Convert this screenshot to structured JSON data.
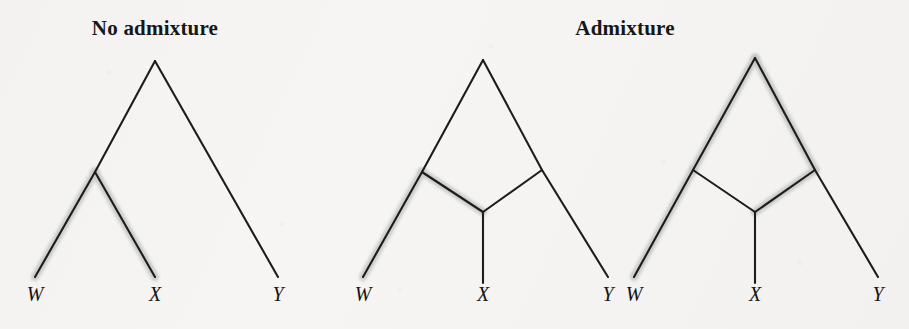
{
  "figure": {
    "width": 909,
    "height": 329,
    "background_color": "#f6f5f3",
    "line_color": "#1d1d1d",
    "highlight_color": "#c9c9c9"
  },
  "panels": [
    {
      "id": "no-admixture",
      "title": "No admixture",
      "title_x": 155,
      "title_y": 32,
      "type": "bifurcating-tree",
      "leaves": [
        {
          "label": "W",
          "x": 35,
          "y": 298
        },
        {
          "label": "X",
          "x": 155,
          "y": 298
        },
        {
          "label": "Y",
          "x": 278,
          "y": 298
        }
      ],
      "nodes": {
        "root": {
          "x": 155,
          "y": 61
        },
        "internal": {
          "x": 95,
          "y": 172
        }
      },
      "edges": [
        {
          "name": "root-to-internal",
          "from": [
            155,
            61
          ],
          "to": [
            95,
            172
          ],
          "highlighted": false
        },
        {
          "name": "root-to-Y",
          "from": [
            155,
            61
          ],
          "to": [
            278,
            277
          ],
          "highlighted": false
        },
        {
          "name": "internal-to-W",
          "from": [
            95,
            172
          ],
          "to": [
            35,
            277
          ],
          "highlighted": true
        },
        {
          "name": "internal-to-X",
          "from": [
            95,
            172
          ],
          "to": [
            155,
            277
          ],
          "highlighted": true
        }
      ]
    },
    {
      "id": "admixture-left",
      "title": "Admixture",
      "title_x": 625,
      "title_y": 32,
      "type": "admixture-graph",
      "leaves": [
        {
          "label": "W",
          "x": 363,
          "y": 298
        },
        {
          "label": "X",
          "x": 483,
          "y": 298
        },
        {
          "label": "Y",
          "x": 608,
          "y": 298
        }
      ],
      "nodes": {
        "root": {
          "x": 483,
          "y": 60
        },
        "left-node": {
          "x": 422,
          "y": 172
        },
        "right-node": {
          "x": 542,
          "y": 170
        },
        "admix-node": {
          "x": 483,
          "y": 212
        }
      },
      "edges": [
        {
          "name": "root-to-left-node",
          "from": [
            483,
            60
          ],
          "to": [
            422,
            172
          ],
          "highlighted": false
        },
        {
          "name": "root-to-right-node",
          "from": [
            483,
            60
          ],
          "to": [
            542,
            170
          ],
          "highlighted": false
        },
        {
          "name": "left-node-to-W",
          "from": [
            422,
            172
          ],
          "to": [
            363,
            277
          ],
          "highlighted": true
        },
        {
          "name": "left-node-to-admix",
          "from": [
            422,
            172
          ],
          "to": [
            483,
            212
          ],
          "highlighted": true
        },
        {
          "name": "right-node-to-admix",
          "from": [
            542,
            170
          ],
          "to": [
            483,
            212
          ],
          "highlighted": false
        },
        {
          "name": "right-node-to-Y",
          "from": [
            542,
            170
          ],
          "to": [
            608,
            277
          ],
          "highlighted": false
        },
        {
          "name": "admix-to-X",
          "from": [
            483,
            212
          ],
          "to": [
            483,
            283
          ],
          "highlighted": true
        }
      ]
    },
    {
      "id": "admixture-right",
      "title": "",
      "title_x": 0,
      "title_y": 0,
      "type": "admixture-graph",
      "leaves": [
        {
          "label": "W",
          "x": 634,
          "y": 298
        },
        {
          "label": "X",
          "x": 755,
          "y": 298
        },
        {
          "label": "Y",
          "x": 878,
          "y": 298
        }
      ],
      "nodes": {
        "root": {
          "x": 755,
          "y": 58
        },
        "left-node": {
          "x": 693,
          "y": 170
        },
        "right-node": {
          "x": 815,
          "y": 170
        },
        "admix-node": {
          "x": 755,
          "y": 212
        }
      },
      "edges": [
        {
          "name": "root-to-left-node",
          "from": [
            755,
            58
          ],
          "to": [
            693,
            170
          ],
          "highlighted": true
        },
        {
          "name": "root-to-right-node",
          "from": [
            755,
            58
          ],
          "to": [
            815,
            170
          ],
          "highlighted": true
        },
        {
          "name": "left-node-to-W",
          "from": [
            693,
            170
          ],
          "to": [
            634,
            277
          ],
          "highlighted": true
        },
        {
          "name": "left-node-to-admix",
          "from": [
            693,
            170
          ],
          "to": [
            755,
            212
          ],
          "highlighted": false
        },
        {
          "name": "right-node-to-admix",
          "from": [
            815,
            170
          ],
          "to": [
            755,
            212
          ],
          "highlighted": true
        },
        {
          "name": "right-node-to-Y",
          "from": [
            815,
            170
          ],
          "to": [
            878,
            277
          ],
          "highlighted": false
        },
        {
          "name": "admix-to-X",
          "from": [
            755,
            212
          ],
          "to": [
            755,
            283
          ],
          "highlighted": true
        }
      ]
    }
  ]
}
